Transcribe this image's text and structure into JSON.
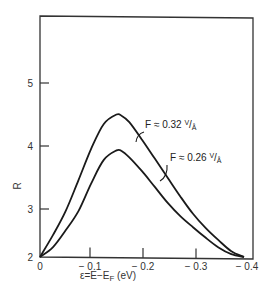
{
  "chart_data": {
    "type": "line",
    "title": "",
    "xlabel": "ε = E − E_F (eV)",
    "ylabel": "R",
    "xlim": [
      0,
      -0.4
    ],
    "ylim": [
      2,
      6
    ],
    "grid": false,
    "legend": "inline annotations",
    "x_ticks": [
      "0",
      "-0.1",
      "-0.2",
      "-0.3",
      "-0.4"
    ],
    "y_ticks": [
      "2",
      "3",
      "4",
      "5"
    ],
    "series": [
      {
        "name": "F ≈ 0.32 V/Å",
        "x": [
          0,
          -0.025,
          -0.05,
          -0.075,
          -0.1,
          -0.125,
          -0.15,
          -0.16,
          -0.175,
          -0.2,
          -0.225,
          -0.25,
          -0.275,
          -0.3,
          -0.325,
          -0.35,
          -0.375,
          -0.4
        ],
        "y": [
          2.0,
          2.45,
          2.95,
          3.45,
          3.95,
          4.35,
          4.5,
          4.48,
          4.38,
          4.1,
          3.8,
          3.5,
          3.2,
          2.9,
          2.6,
          2.35,
          2.12,
          2.0
        ]
      },
      {
        "name": "F ≈ 0.26 V/Å",
        "x": [
          0,
          -0.025,
          -0.05,
          -0.075,
          -0.1,
          -0.125,
          -0.15,
          -0.16,
          -0.175,
          -0.2,
          -0.225,
          -0.25,
          -0.275,
          -0.3,
          -0.325,
          -0.35,
          -0.375,
          -0.4
        ],
        "y": [
          2.0,
          2.2,
          2.55,
          2.95,
          3.4,
          3.78,
          3.93,
          3.92,
          3.82,
          3.6,
          3.35,
          3.1,
          2.85,
          2.62,
          2.4,
          2.2,
          2.06,
          2.0
        ]
      }
    ],
    "annotations": [
      {
        "text_main": "F ≈ 0.32 ",
        "unit_num": "V",
        "unit_den": "Å",
        "series": 0
      },
      {
        "text_main": "F ≈ 0.26 ",
        "unit_num": "V",
        "unit_den": "Å",
        "series": 1
      }
    ]
  },
  "colors": {
    "line": "#1a1a1a",
    "frame": "#333333",
    "background": "#ffffff"
  }
}
